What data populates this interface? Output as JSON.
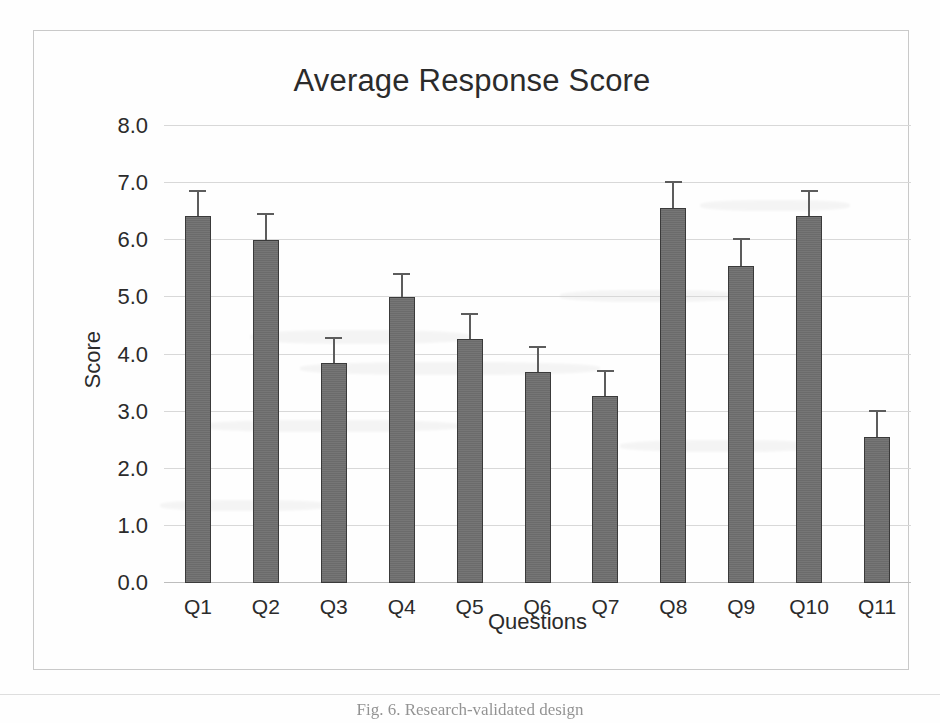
{
  "figure": {
    "caption": "Fig. 6.  Research-validated design"
  },
  "chart_data": {
    "type": "bar",
    "title": "Average Response Score",
    "xlabel": "Questions",
    "ylabel": "Score",
    "ylim": [
      0.0,
      8.0
    ],
    "ytick_step": 1.0,
    "grid": true,
    "legend": "none",
    "bar_color": "#6f6f6f",
    "bar_edge_color": "#3a3a3a",
    "error_bar_color": "#5c5c5c",
    "error_bar_style": "upper-only",
    "categories": [
      "Q1",
      "Q2",
      "Q3",
      "Q4",
      "Q5",
      "Q6",
      "Q7",
      "Q8",
      "Q9",
      "Q10",
      "Q11"
    ],
    "values": [
      6.43,
      6.0,
      3.85,
      5.0,
      4.27,
      3.7,
      3.27,
      6.57,
      5.55,
      6.42,
      2.55
    ],
    "error_upper": [
      0.42,
      0.45,
      0.42,
      0.4,
      0.43,
      0.42,
      0.43,
      0.43,
      0.45,
      0.43,
      0.45
    ],
    "error_top_values": [
      6.85,
      6.45,
      4.27,
      5.4,
      4.7,
      4.12,
      3.7,
      7.0,
      6.0,
      6.85,
      3.0
    ],
    "ytick_labels": [
      "8.0",
      "7.0",
      "6.0",
      "5.0",
      "4.0",
      "3.0",
      "2.0",
      "1.0",
      "0.0"
    ],
    "ytick_values": [
      8.0,
      7.0,
      6.0,
      5.0,
      4.0,
      3.0,
      2.0,
      1.0,
      0.0
    ]
  }
}
